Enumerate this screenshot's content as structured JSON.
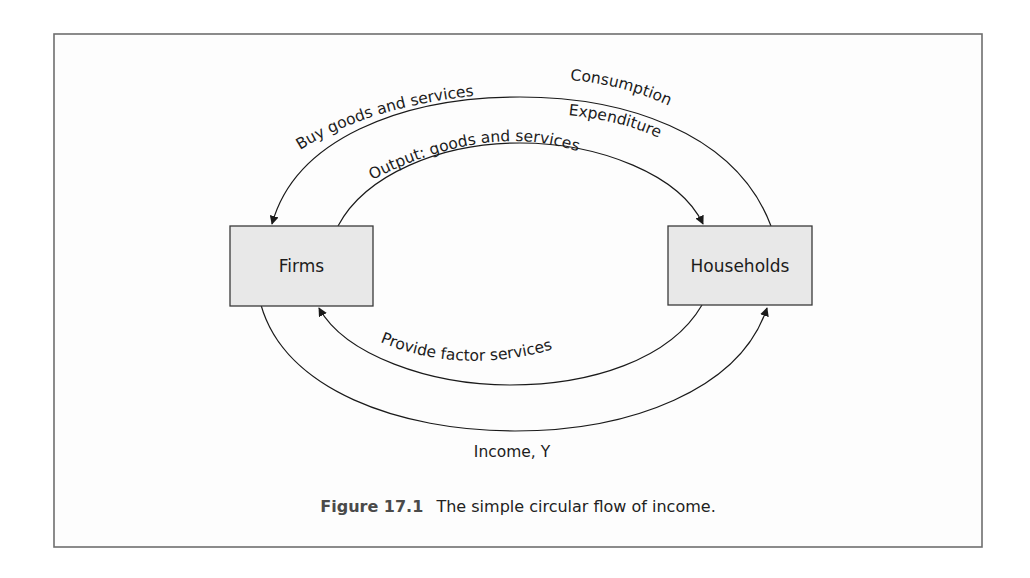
{
  "figure": {
    "number": "Figure 17.1",
    "title": "The simple circular flow of income."
  },
  "nodes": {
    "firms": {
      "label": "Firms"
    },
    "households": {
      "label": "Households"
    }
  },
  "flows": {
    "buy_goods": {
      "label": "Buy goods and services",
      "from": "Households",
      "to": "Firms"
    },
    "consumption": {
      "label": "Consumption"
    },
    "expenditure": {
      "label": "Expenditure"
    },
    "output": {
      "label": "Output: goods and services",
      "from": "Firms",
      "to": "Households"
    },
    "factor_services": {
      "label": "Provide factor services",
      "from": "Households",
      "to": "Firms"
    },
    "income": {
      "label": "Income, Y",
      "from": "Firms",
      "to": "Households"
    }
  },
  "colors": {
    "box_fill": "#e8e8e8",
    "box_stroke": "#3a3a3a",
    "frame_stroke": "#6e6e6e",
    "line": "#1a1a1a"
  }
}
